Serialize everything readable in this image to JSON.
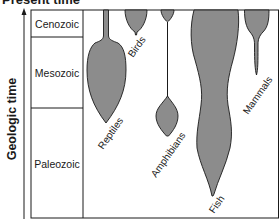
{
  "diagram": {
    "title": "Present time",
    "axis_label": "Geologic time",
    "eras": [
      {
        "name": "Cenozoic"
      },
      {
        "name": "Mesozoic"
      },
      {
        "name": "Paleozoic"
      }
    ],
    "groups": [
      {
        "name": "Reptiles"
      },
      {
        "name": "Birds"
      },
      {
        "name": "Amphibians"
      },
      {
        "name": "Fish"
      },
      {
        "name": "Mammals"
      }
    ],
    "colors": {
      "shape_fill": "#8c8c8c",
      "outline": "#1a1a1a",
      "background": "#ffffff"
    }
  }
}
